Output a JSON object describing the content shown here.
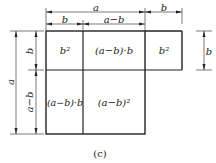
{
  "diagram": {
    "top_dims": {
      "a": "a",
      "b_left": "b",
      "a_minus_b": "a−b",
      "b_right": "b"
    },
    "left_dims": {
      "a": "a",
      "b": "b",
      "a_minus_b": "a−b"
    },
    "right_dim": {
      "b": "b"
    },
    "cells": {
      "top_left": "b²",
      "top_middle": "(a−b)·b",
      "top_right": "b²",
      "bottom_left": "(a−b)·b",
      "bottom_middle": "(a−b)²"
    },
    "caption": "(c)"
  }
}
